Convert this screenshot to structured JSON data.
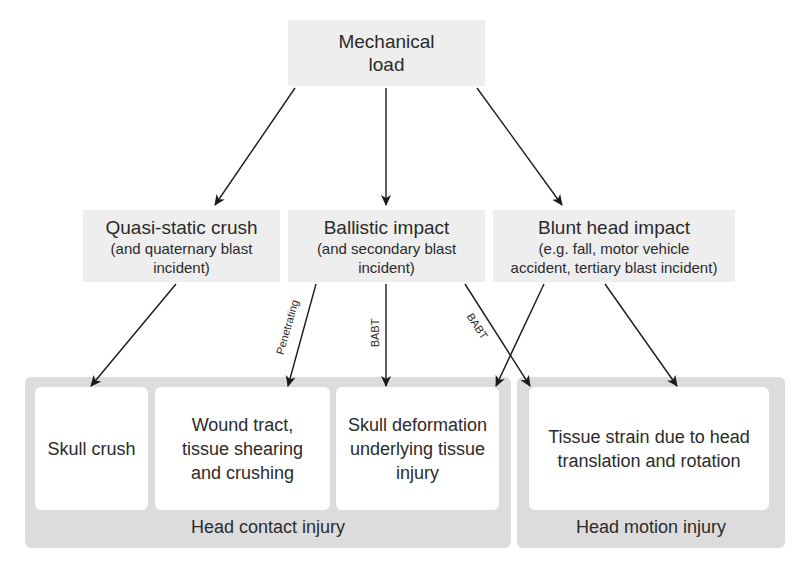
{
  "diagram": {
    "root": {
      "title": "Mechanical load"
    },
    "causes": [
      {
        "title": "Quasi-static crush",
        "subtitle": "(and quaternary blast incident)"
      },
      {
        "title": "Ballistic impact",
        "subtitle": "(and secondary blast incident)"
      },
      {
        "title": "Blunt head impact",
        "subtitle": "(e.g. fall, motor vehicle accident, tertiary blast incident)"
      }
    ],
    "groups": [
      {
        "label": "Head contact injury",
        "items": [
          {
            "text": "Skull crush"
          },
          {
            "text": "Wound tract, tissue shearing and crushing"
          },
          {
            "text": "Skull deformation underlying tissue injury"
          }
        ]
      },
      {
        "label": "Head motion injury",
        "items": [
          {
            "text": "Tissue strain due to head translation and rotation"
          }
        ]
      }
    ],
    "edge_labels": {
      "penetrating": "Penetrating",
      "babt_vertical": "BABT",
      "babt_diagonal": "BABT"
    },
    "edges": [
      {
        "from": "Mechanical load",
        "to": "Quasi-static crush"
      },
      {
        "from": "Mechanical load",
        "to": "Ballistic impact"
      },
      {
        "from": "Mechanical load",
        "to": "Blunt head impact"
      },
      {
        "from": "Quasi-static crush",
        "to": "Skull crush"
      },
      {
        "from": "Ballistic impact",
        "to": "Wound tract, tissue shearing and crushing",
        "label": "Penetrating"
      },
      {
        "from": "Ballistic impact",
        "to": "Skull deformation underlying tissue injury",
        "label": "BABT"
      },
      {
        "from": "Ballistic impact",
        "to": "Tissue strain due to head translation and rotation",
        "label": "BABT"
      },
      {
        "from": "Blunt head impact",
        "to": "Skull deformation underlying tissue injury"
      },
      {
        "from": "Blunt head impact",
        "to": "Tissue strain due to head translation and rotation"
      }
    ]
  }
}
